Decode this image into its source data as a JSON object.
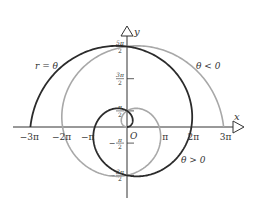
{
  "diagram": {
    "curve_label": "r = θ",
    "branch_positive_label": "θ > 0",
    "branch_negative_label": "θ < 0",
    "origin_label": "O",
    "x_axis_label": "x",
    "y_axis_label": "y",
    "x_ticks": [
      {
        "value": -3,
        "label": "−3π"
      },
      {
        "value": -2,
        "label": "−2π"
      },
      {
        "value": -1,
        "label": "−π"
      },
      {
        "value": 1,
        "label": "π"
      },
      {
        "value": 2,
        "label": "2π"
      },
      {
        "value": 3,
        "label": "3π"
      }
    ],
    "y_ticks": [
      {
        "value": 2.5,
        "num": "5π",
        "den": "2",
        "sign": ""
      },
      {
        "value": 1.5,
        "num": "3π",
        "den": "2",
        "sign": ""
      },
      {
        "value": 0.5,
        "num": "π",
        "den": "2",
        "sign": ""
      },
      {
        "value": -0.5,
        "num": "π",
        "den": "2",
        "sign": "−"
      },
      {
        "value": -1.5,
        "num": "3π",
        "den": "2",
        "sign": "−"
      }
    ],
    "theta_range_multiples_of_pi": [
      0,
      3
    ],
    "colors": {
      "positive_branch": "#2b2b2b",
      "negative_branch": "#a8a8a8",
      "axes": "#333333"
    }
  }
}
